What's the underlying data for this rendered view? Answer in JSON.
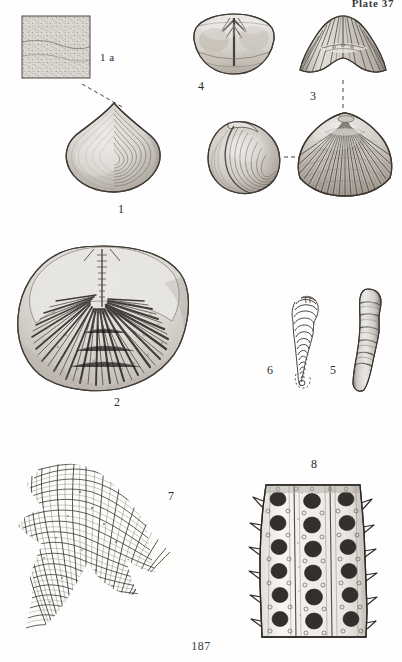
{
  "plate": {
    "header": "Plate 37",
    "page_number": "187",
    "background_color": "#fefefe",
    "ink_color": "#2b2b2b"
  },
  "figures": [
    {
      "id": "fig-1a",
      "label": "1 a",
      "caption_name": "magnified-shell-surface-inset",
      "description": "rectangular magnified inset of punctate shell surface texture",
      "x": 22,
      "y": 16,
      "width": 68,
      "height": 62
    },
    {
      "id": "fig-1",
      "label": "1",
      "caption_name": "smooth-shell-concentric",
      "description": "smooth subtriangular shell with concentric growth lines",
      "x": 63,
      "y": 100,
      "width": 100,
      "height": 92
    },
    {
      "id": "fig-4",
      "label": "4",
      "caption_name": "shell-posterior-interior-view",
      "description": "posterior interior view of valve with median septum",
      "x": 192,
      "y": 12,
      "width": 82,
      "height": 68
    },
    {
      "id": "fig-3-anterior",
      "label": "",
      "caption_name": "ribbed-shell-anterior-view",
      "description": "anterior view of ribbed shell with fold and sulcus",
      "x": 298,
      "y": 14,
      "width": 88,
      "height": 62
    },
    {
      "id": "fig-3-lateral",
      "label": "",
      "caption_name": "ribbed-shell-lateral-view",
      "description": "lateral oblique view of shell",
      "x": 204,
      "y": 118,
      "width": 80,
      "height": 76
    },
    {
      "id": "fig-3",
      "label": "3",
      "caption_name": "ribbed-rhynchonellid-shell",
      "description": "ribbed rhynchonellid brachiopod, dorsal view with radiating costae",
      "x": 295,
      "y": 110,
      "width": 98,
      "height": 86
    },
    {
      "id": "fig-2",
      "label": "2",
      "caption_name": "shell-interior-radiating-spines",
      "description": "shell interior showing radiating prismatic spines",
      "x": 14,
      "y": 243,
      "width": 178,
      "height": 152
    },
    {
      "id": "fig-6",
      "label": "6",
      "caption_name": "foraminifera-outline-drawing",
      "description": "line outline drawing of uniserial chambered foraminifer",
      "x": 283,
      "y": 294,
      "width": 42,
      "height": 96
    },
    {
      "id": "fig-5",
      "label": "5",
      "caption_name": "foraminifera-rendered-test",
      "description": "stippled rendered foraminifer test with constricted chambers",
      "x": 344,
      "y": 286,
      "width": 42,
      "height": 108
    },
    {
      "id": "fig-7",
      "label": "7",
      "caption_name": "bryozoan-reticulate-mesh",
      "description": "fenestrate bryozoan colony with reticulate mesh of zooecia",
      "x": 16,
      "y": 462,
      "width": 166,
      "height": 172
    },
    {
      "id": "fig-8",
      "label": "8",
      "caption_name": "bryozoan-branch-apertures",
      "description": "bryozoan branch with rows of dark oval apertures and marginal spines",
      "x": 248,
      "y": 477,
      "width": 128,
      "height": 160
    }
  ],
  "labels": [
    {
      "name": "label-1a",
      "text": "1 a",
      "x": 100,
      "y": 52
    },
    {
      "name": "label-1",
      "text": "1",
      "x": 118,
      "y": 203
    },
    {
      "name": "label-4",
      "text": "4",
      "x": 198,
      "y": 80
    },
    {
      "name": "label-3",
      "text": "3",
      "x": 310,
      "y": 90
    },
    {
      "name": "label-2",
      "text": "2",
      "x": 114,
      "y": 396
    },
    {
      "name": "label-6",
      "text": "6",
      "x": 267,
      "y": 364
    },
    {
      "name": "label-5",
      "text": "5",
      "x": 330,
      "y": 364
    },
    {
      "name": "label-8",
      "text": "8",
      "x": 311,
      "y": 458
    },
    {
      "name": "label-7",
      "text": "7",
      "x": 168,
      "y": 490
    }
  ],
  "connectors": [
    {
      "name": "connector-1a-to-1",
      "from": [
        88,
        88
      ],
      "to": [
        122,
        106
      ],
      "style": "dashed"
    },
    {
      "name": "connector-3-vertical",
      "from": [
        342,
        82
      ],
      "to": [
        342,
        112
      ],
      "style": "dashed"
    },
    {
      "name": "connector-3-lateral",
      "from": [
        286,
        157
      ],
      "to": [
        306,
        157
      ],
      "style": "dashed"
    }
  ]
}
